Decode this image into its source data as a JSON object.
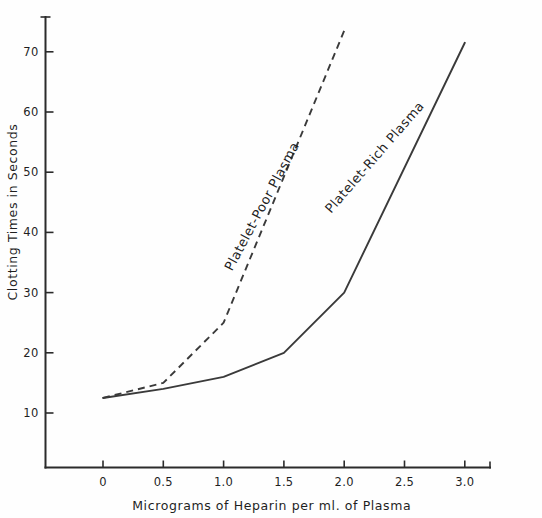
{
  "chart_data": {
    "type": "line",
    "title": "",
    "xlabel": "Micrograms of Heparin per ml. of Plasma",
    "ylabel": "Clotting Times in Seconds",
    "xlim": [
      -0.35,
      3.4
    ],
    "ylim": [
      0,
      76
    ],
    "grid": false,
    "legend_position": "inline-annotations",
    "x_ticks": [
      {
        "value": 0,
        "label": "0"
      },
      {
        "value": 0.5,
        "label": "0.5"
      },
      {
        "value": 1.0,
        "label": "1.0"
      },
      {
        "value": 1.5,
        "label": "1.5"
      },
      {
        "value": 2.0,
        "label": "2.0"
      },
      {
        "value": 2.5,
        "label": "2.5"
      },
      {
        "value": 3.0,
        "label": "3.0"
      }
    ],
    "y_ticks": [
      {
        "value": 10,
        "label": "10"
      },
      {
        "value": 20,
        "label": "20"
      },
      {
        "value": 30,
        "label": "30"
      },
      {
        "value": 40,
        "label": "40"
      },
      {
        "value": 50,
        "label": "50"
      },
      {
        "value": 60,
        "label": "60"
      },
      {
        "value": 70,
        "label": "70"
      }
    ],
    "series": [
      {
        "name": "Platelet-Poor Plasma",
        "style": "dashed",
        "color": "#3a3a3a",
        "x": [
          0,
          0.5,
          1.0,
          2.0
        ],
        "values": [
          12.5,
          15.0,
          25.0,
          73.5
        ]
      },
      {
        "name": "Platelet-Rich Plasma",
        "style": "solid",
        "color": "#3a3a3a",
        "x": [
          0,
          0.5,
          1.0,
          1.5,
          2.0,
          3.0
        ],
        "values": [
          12.5,
          14.0,
          16.0,
          20.0,
          30.0,
          71.5
        ]
      }
    ],
    "annotations": [
      {
        "text": "Platelet-Poor Plasma",
        "x": 1.35,
        "y": 44,
        "rotation": -62
      },
      {
        "text": "Platelet-Rich Plasma",
        "x": 2.28,
        "y": 52,
        "rotation": -49
      }
    ]
  }
}
